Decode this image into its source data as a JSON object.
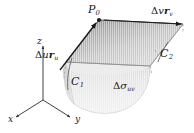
{
  "figure": {
    "background_color": "#ffffff",
    "ink_color": "#1a1a1a",
    "tangent_plane_fill": "#c9c9c9",
    "tangent_plane_shade_dark": "#8e8e8e",
    "surface_patch_fill": "#e3e3e3",
    "surface_patch_shade": "#cfcfcf",
    "edge_color": "#6b6b6b",
    "dash_color": "#9a9a9a"
  },
  "labels": {
    "point_p0": {
      "base": "P",
      "sub": "0"
    },
    "delta_v_r_v": {
      "delta": "Δ",
      "scalar": "v",
      "vector": "r",
      "sub": "v"
    },
    "delta_u_r_u": {
      "delta": "Δ",
      "scalar": "u",
      "vector": "r",
      "sub": "u"
    },
    "curve_c1": {
      "base": "C",
      "sub": "1"
    },
    "curve_c2": {
      "base": "C",
      "sub": "2"
    },
    "patch_area": {
      "delta": "Δ",
      "sigma": "σ",
      "sub": "uv"
    }
  },
  "axes": {
    "x_label": "x",
    "y_label": "y",
    "z_label": "z",
    "origin": {
      "x": 43,
      "y": 100
    },
    "endpoints": {
      "x": {
        "x": 14,
        "y": 118
      },
      "y": {
        "x": 72,
        "y": 118
      },
      "z": {
        "x": 43,
        "y": 44
      }
    }
  },
  "geometry": {
    "tangent_plane_corners": [
      {
        "name": "p0",
        "x": 99,
        "y": 20
      },
      {
        "name": "v_end",
        "x": 183,
        "y": 24
      },
      {
        "name": "uv_end",
        "x": 150,
        "y": 66
      },
      {
        "name": "u_end",
        "x": 66,
        "y": 62
      }
    ],
    "surface_patch_top_corners": [
      {
        "name": "near_left",
        "x": 66,
        "y": 62
      },
      {
        "name": "near_right",
        "x": 150,
        "y": 66
      }
    ],
    "vector_arrows": [
      {
        "name": "delta-u-r-u",
        "from_x": 66,
        "from_y": 62,
        "to_x": 99,
        "to_y": 20
      },
      {
        "name": "delta-v-r-v",
        "from_x": 99,
        "from_y": 20,
        "to_x": 183,
        "to_y": 24
      }
    ]
  }
}
